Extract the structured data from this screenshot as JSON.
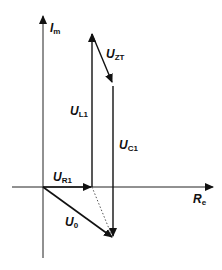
{
  "diagram": {
    "type": "phasor-diagram",
    "axes": {
      "vertical": {
        "symbol": "I",
        "subscript": "m"
      },
      "horizontal": {
        "symbol": "R",
        "subscript": "e"
      }
    },
    "phasors": [
      {
        "id": "UR1",
        "symbol": "U",
        "subscript": "R1",
        "from": [
          43,
          187
        ],
        "to": [
          92,
          187
        ]
      },
      {
        "id": "UL1",
        "symbol": "U",
        "subscript": "L1",
        "from": [
          92,
          187
        ],
        "to": [
          92,
          33
        ]
      },
      {
        "id": "UZT",
        "symbol": "U",
        "subscript": "ZT",
        "from": [
          92,
          33
        ],
        "to": [
          113,
          84
        ]
      },
      {
        "id": "UC1",
        "symbol": "U",
        "subscript": "C1",
        "from": [
          113,
          86
        ],
        "to": [
          113,
          238
        ]
      },
      {
        "id": "U0",
        "symbol": "U",
        "subscript": "0",
        "from": [
          43,
          187
        ],
        "to": [
          113,
          238
        ]
      }
    ],
    "dotted_line": {
      "from": [
        92,
        187
      ],
      "to": [
        113,
        238
      ]
    },
    "colors": {
      "line": "#111111",
      "axis": "#222222",
      "background": "#ffffff"
    }
  }
}
